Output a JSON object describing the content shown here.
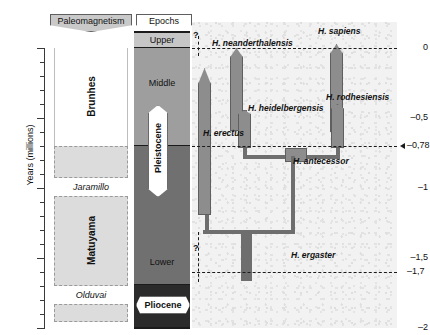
{
  "axis": {
    "title": "Years (millions)",
    "major_ticks": [
      {
        "label": "0",
        "value": 0.0,
        "y": 48
      },
      {
        "label": "–0,5",
        "value": -0.5,
        "y": 118
      },
      {
        "label": "–1",
        "value": -1.0,
        "y": 188
      },
      {
        "label": "–1,5",
        "value": -1.5,
        "y": 258
      },
      {
        "label": "–2",
        "value": -2.0,
        "y": 328
      }
    ],
    "minor_tick_step": 0.1
  },
  "headers": {
    "paleomagnetism": "Paleomagnetism",
    "epochs": "Epochs"
  },
  "paleomagnetism": {
    "bands": [
      {
        "name": "Brunhes",
        "style": "white",
        "orientation": "vertical",
        "top": 48,
        "bottom": 146,
        "label_top": 70
      },
      {
        "name": "",
        "style": "fill",
        "orientation": "none",
        "top": 146,
        "bottom": 178
      },
      {
        "name": "Jaramillo",
        "style": "label",
        "orientation": "horizontal",
        "top": 178,
        "bottom": 196
      },
      {
        "name": "Matuyama",
        "style": "fill",
        "orientation": "vertical",
        "top": 196,
        "bottom": 286,
        "label_top": 215
      },
      {
        "name": "Olduvai",
        "style": "label",
        "orientation": "horizontal",
        "top": 286,
        "bottom": 304
      },
      {
        "name": "",
        "style": "fill",
        "orientation": "none",
        "top": 304,
        "bottom": 322
      }
    ]
  },
  "epochs": {
    "pleistocene_label": "Pleistocene",
    "pliocene_label": "Pliocene",
    "subdivisions": [
      {
        "name": "Upper",
        "top": 32,
        "bottom": 48,
        "color": "#c6c6c6"
      },
      {
        "name": "Middle",
        "top": 48,
        "bottom": 146,
        "color": "#9e9e9e"
      },
      {
        "name": "Lower",
        "top": 146,
        "bottom": 285,
        "color": "#707070"
      },
      {
        "name": "",
        "top": 285,
        "bottom": 328,
        "color": "#2b2b2b"
      }
    ]
  },
  "phylogeny": {
    "boundary_lines": [
      {
        "label": "",
        "value": 0.0,
        "y": 48,
        "arrow": false
      },
      {
        "label": "–0,78",
        "value": -0.78,
        "y": 146,
        "arrow": true
      },
      {
        "label": "–1,7",
        "value": -1.7,
        "y": 272,
        "arrow": false
      }
    ],
    "uncertainty_marks": [
      {
        "symbol": "?",
        "x": 196,
        "y": 30
      },
      {
        "symbol": "?",
        "x": 196,
        "y": 243
      }
    ],
    "taxa": [
      {
        "name": "H. neanderthalensis",
        "top": 48,
        "bottom": 131,
        "label_x": 212,
        "label_y": 38
      },
      {
        "name": "H. sapiens",
        "top": 44,
        "bottom": 132,
        "label_x": 318,
        "label_y": 26
      },
      {
        "name": "H. heidelbergensis",
        "top": 110,
        "bottom": 148,
        "label_x": 248,
        "label_y": 103
      },
      {
        "name": "H. rodhesiensis",
        "top": 104,
        "bottom": 148,
        "label_x": 326,
        "label_y": 92
      },
      {
        "name": "H. erectus",
        "top": 68,
        "bottom": 215,
        "label_x": 203,
        "label_y": 128
      },
      {
        "name": "H. antecessor",
        "top": 148,
        "bottom": 233,
        "label_x": 293,
        "label_y": 156
      },
      {
        "name": "H. ergaster",
        "top": 233,
        "bottom": 281,
        "label_x": 291,
        "label_y": 250
      }
    ]
  },
  "colors": {
    "lineage_fill": "#8d8d8d",
    "branch": "#6e6e6e",
    "panel_bg": "#f2f2f2",
    "band_fill": "#dcdcdc",
    "epoch_upper": "#c6c6c6",
    "epoch_middle": "#9e9e9e",
    "epoch_lower": "#707070",
    "epoch_pliocene": "#2b2b2b"
  }
}
